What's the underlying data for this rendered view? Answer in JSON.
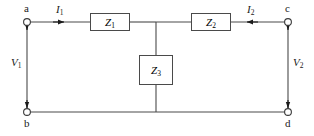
{
  "figure": {
    "kind": "two-port-t-network-circuit-diagram",
    "background_color": "#ffffff",
    "line_color": "#4a4a4a",
    "text_color": "#1a1a1a"
  },
  "terminals": [
    {
      "id": "a",
      "label": "a",
      "position": "top-left"
    },
    {
      "id": "b",
      "label": "b",
      "position": "bottom-left"
    },
    {
      "id": "c",
      "label": "c",
      "position": "top-right"
    },
    {
      "id": "d",
      "label": "d",
      "position": "bottom-right"
    }
  ],
  "impedances": [
    {
      "id": "Z1",
      "label": "Z",
      "sub": "1",
      "orientation": "horizontal",
      "branch": "top-left-series"
    },
    {
      "id": "Z2",
      "label": "Z",
      "sub": "2",
      "orientation": "horizontal",
      "branch": "top-right-series"
    },
    {
      "id": "Z3",
      "label": "Z",
      "sub": "3",
      "orientation": "vertical",
      "branch": "center-shunt"
    }
  ],
  "currents": [
    {
      "id": "I1",
      "label": "I",
      "sub": "1",
      "direction": "right",
      "branch": "input-top-left"
    },
    {
      "id": "I2",
      "label": "I",
      "sub": "2",
      "direction": "left",
      "branch": "output-top-right"
    }
  ],
  "voltages": [
    {
      "id": "V1",
      "label": "V",
      "sub": "1",
      "side": "left",
      "across": "a-b"
    },
    {
      "id": "V2",
      "label": "V",
      "sub": "2",
      "side": "right",
      "across": "c-d"
    }
  ]
}
